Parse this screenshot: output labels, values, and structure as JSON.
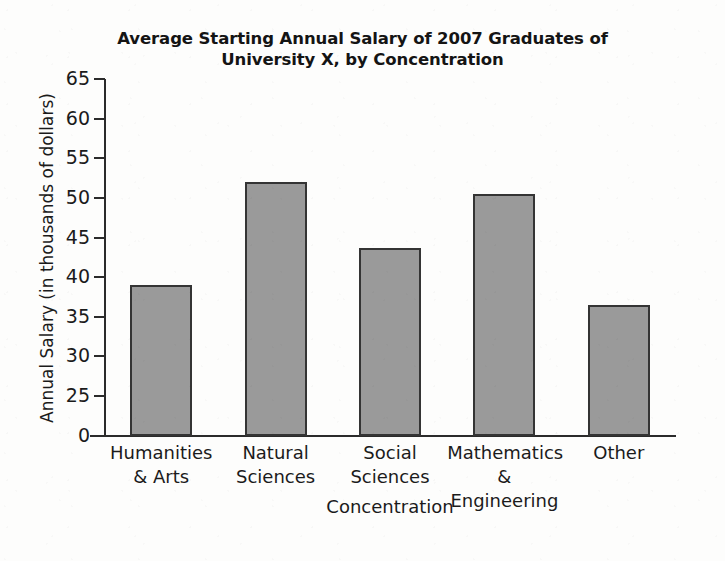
{
  "chart_data": {
    "type": "bar",
    "title": "Average Starting  Annual Salary of 2007 Graduates of University X, by Concentration",
    "title_line1": "Average Starting  Annual Salary of 2007 Graduates of",
    "title_line2": "University X, by Concentration",
    "xlabel": "Concentration",
    "ylabel": "Annual Salary (in thousands of dollars)",
    "categories": [
      "Humanities & Arts",
      "Natural Sciences",
      "Social Sciences",
      "Mathematics & Engineering",
      "Other"
    ],
    "category_lines": [
      [
        "Humanities",
        "& Arts"
      ],
      [
        "Natural",
        "Sciences"
      ],
      [
        "Social",
        "Sciences"
      ],
      [
        "Mathematics &",
        "Engineering"
      ],
      [
        "Other",
        ""
      ]
    ],
    "values": [
      39,
      52,
      43.7,
      50.5,
      36.5
    ],
    "value_unit": "thousands of dollars",
    "ylim": [
      25,
      65
    ],
    "y_axis_broken": true,
    "y_break_between": [
      0,
      25
    ],
    "ytick_labels": [
      "65",
      "60",
      "55",
      "50",
      "45",
      "40",
      "35",
      "30",
      "25",
      "0"
    ],
    "ytick_values": [
      65,
      60,
      55,
      50,
      45,
      40,
      35,
      30,
      25,
      0
    ],
    "grid": false,
    "legend": false,
    "colors": {
      "bar_fill": "#9a9a9a",
      "bar_border": "#343434",
      "axis": "#2b2b2b",
      "text": "#1b1b1b",
      "background": "#fdfdfc"
    }
  }
}
